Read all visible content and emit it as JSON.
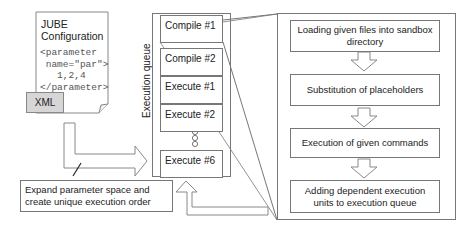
{
  "config_document": {
    "title_line1": "JUBE",
    "title_line2": "Configuration",
    "code": "<parameter\n name=\"par\">\n   1,2,4\n</parameter>",
    "tag": "XML"
  },
  "caption": {
    "text": "Expand parameter space and create unique execution order"
  },
  "execution_queue": {
    "label": "Execution queue",
    "items": [
      {
        "label": "Compile #1"
      },
      {
        "label": "Compile #2"
      },
      {
        "label": "Execute #1"
      },
      {
        "label": "Execute #2"
      },
      {
        "label": "Execute #6"
      }
    ],
    "ellipsis": "three-circles"
  },
  "process_steps": [
    {
      "label": "Loading given files into sandbox directory"
    },
    {
      "label": "Substitution of placeholders"
    },
    {
      "label": "Execution of given commands"
    },
    {
      "label": "Adding dependent execution units to execution queue"
    }
  ],
  "colors": {
    "stroke": "#777777",
    "tag_fill": "#d6d6d6",
    "background": "#ffffff"
  }
}
